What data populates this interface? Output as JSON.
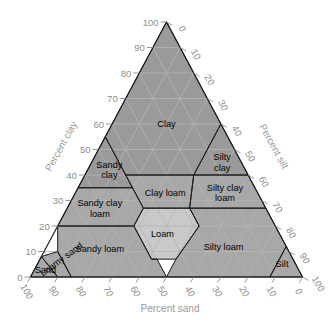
{
  "figure": {
    "type": "soil-texture-triangle",
    "background_color": "#ffffff"
  },
  "chart_data": {
    "type": "ternary-diagram",
    "title": "",
    "axes": [
      {
        "name": "clay",
        "label": "Percent clay",
        "position": "left",
        "range": [
          0,
          100
        ],
        "ticks": [
          0,
          10,
          20,
          30,
          40,
          50,
          60,
          70,
          80,
          90,
          100
        ]
      },
      {
        "name": "silt",
        "label": "Percent silt",
        "position": "right",
        "range": [
          0,
          100
        ],
        "ticks": [
          0,
          10,
          20,
          30,
          40,
          50,
          60,
          70,
          80,
          90,
          100
        ]
      },
      {
        "name": "sand",
        "label": "Percent sand",
        "position": "bottom",
        "range": [
          0,
          100
        ],
        "ticks": [
          0,
          10,
          20,
          30,
          40,
          50,
          60,
          70,
          80,
          90,
          100
        ]
      }
    ],
    "grid": true,
    "grid_interval": 10,
    "legend": "none",
    "colors": {
      "fill_dark": "#9a9a9a",
      "fill_mid": "#a8a8a8",
      "fill_light": "#c9c9c9",
      "grid_line": "#b5b5b5",
      "boundary_line": "#1a1a1a",
      "tick_text": "#8d8d8d",
      "axis_title": "#9a9a9a",
      "label_text": "#000000"
    },
    "regions": [
      {
        "name": "clay",
        "label": "Clay",
        "shade": "dark",
        "label_position": {
          "clay": 60,
          "silt": 20,
          "sand": 20
        },
        "vertices": [
          {
            "clay": 100,
            "silt": 0,
            "sand": 0
          },
          {
            "clay": 55,
            "silt": 0,
            "sand": 45
          },
          {
            "clay": 40,
            "silt": 15,
            "sand": 45
          },
          {
            "clay": 40,
            "silt": 40,
            "sand": 20
          },
          {
            "clay": 60,
            "silt": 40,
            "sand": 0
          }
        ]
      },
      {
        "name": "sandy-clay",
        "label": "Sandy\nclay",
        "label_lines": [
          "Sandy",
          "clay"
        ],
        "shade": "dark",
        "label_position": {
          "clay": 42,
          "silt": 8,
          "sand": 50
        },
        "vertices": [
          {
            "clay": 55,
            "silt": 0,
            "sand": 45
          },
          {
            "clay": 35,
            "silt": 0,
            "sand": 65
          },
          {
            "clay": 35,
            "silt": 20,
            "sand": 45
          }
        ]
      },
      {
        "name": "silty-clay",
        "label": "Silty\nclay",
        "label_lines": [
          "Silty",
          "clay"
        ],
        "shade": "dark",
        "label_position": {
          "clay": 45,
          "silt": 48,
          "sand": 7
        },
        "vertices": [
          {
            "clay": 60,
            "silt": 40,
            "sand": 0
          },
          {
            "clay": 40,
            "silt": 40,
            "sand": 20
          },
          {
            "clay": 40,
            "silt": 60,
            "sand": 0
          }
        ]
      },
      {
        "name": "sandy-clay-loam",
        "label": "Sandy clay\nloam",
        "label_lines": [
          "Sandy clay",
          "loam"
        ],
        "shade": "mid",
        "label_position": {
          "clay": 27,
          "silt": 12,
          "sand": 61
        },
        "vertices": [
          {
            "clay": 35,
            "silt": 0,
            "sand": 65
          },
          {
            "clay": 20,
            "silt": 0,
            "sand": 80
          },
          {
            "clay": 20,
            "silt": 28,
            "sand": 52
          },
          {
            "clay": 27,
            "silt": 28,
            "sand": 45
          },
          {
            "clay": 35,
            "silt": 20,
            "sand": 45
          }
        ]
      },
      {
        "name": "clay-loam",
        "label": "Clay loam",
        "shade": "mid",
        "label_position": {
          "clay": 33,
          "silt": 33,
          "sand": 34
        },
        "vertices": [
          {
            "clay": 40,
            "silt": 15,
            "sand": 45
          },
          {
            "clay": 27,
            "silt": 28,
            "sand": 45
          },
          {
            "clay": 27,
            "silt": 45,
            "sand": 28
          },
          {
            "clay": 40,
            "silt": 40,
            "sand": 20
          }
        ]
      },
      {
        "name": "silty-clay-loam",
        "label": "Silty clay\nloam",
        "label_lines": [
          "Silty clay",
          "loam"
        ],
        "shade": "mid",
        "label_position": {
          "clay": 33,
          "silt": 55,
          "sand": 12
        },
        "vertices": [
          {
            "clay": 40,
            "silt": 40,
            "sand": 20
          },
          {
            "clay": 27,
            "silt": 45,
            "sand": 28
          },
          {
            "clay": 27,
            "silt": 73,
            "sand": 0
          },
          {
            "clay": 40,
            "silt": 60,
            "sand": 0
          }
        ]
      },
      {
        "name": "loam",
        "label": "Loam",
        "shade": "light",
        "label_position": {
          "clay": 17,
          "silt": 40,
          "sand": 43
        },
        "vertices": [
          {
            "clay": 27,
            "silt": 28,
            "sand": 45
          },
          {
            "clay": 20,
            "silt": 28,
            "sand": 52
          },
          {
            "clay": 7,
            "silt": 41,
            "sand": 52
          },
          {
            "clay": 7,
            "silt": 50,
            "sand": 43
          },
          {
            "clay": 20,
            "silt": 52,
            "sand": 28
          },
          {
            "clay": 27,
            "silt": 45,
            "sand": 28
          }
        ]
      },
      {
        "name": "sandy-loam",
        "label": "Sandy loam",
        "shade": "mid",
        "label_position": {
          "clay": 11,
          "silt": 20,
          "sand": 69
        },
        "vertices": [
          {
            "clay": 20,
            "silt": 0,
            "sand": 80
          },
          {
            "clay": 20,
            "silt": 28,
            "sand": 52
          },
          {
            "clay": 7,
            "silt": 41,
            "sand": 52
          },
          {
            "clay": 7,
            "silt": 43,
            "sand": 50
          },
          {
            "clay": 0,
            "silt": 50,
            "sand": 50
          },
          {
            "clay": 0,
            "silt": 15,
            "sand": 85
          },
          {
            "clay": 10,
            "silt": 5,
            "sand": 85
          }
        ]
      },
      {
        "name": "silty-loam",
        "label": "Silty loam",
        "shade": "mid",
        "label_position": {
          "clay": 12,
          "silt": 65,
          "sand": 23
        },
        "vertices": [
          {
            "clay": 27,
            "silt": 73,
            "sand": 0
          },
          {
            "clay": 27,
            "silt": 45,
            "sand": 28
          },
          {
            "clay": 20,
            "silt": 52,
            "sand": 28
          },
          {
            "clay": 7,
            "silt": 50,
            "sand": 43
          },
          {
            "clay": 0,
            "silt": 50,
            "sand": 50
          },
          {
            "clay": 0,
            "silt": 88,
            "sand": 12
          },
          {
            "clay": 12,
            "silt": 88,
            "sand": 0
          }
        ]
      },
      {
        "name": "silt",
        "label": "Silt",
        "shade": "mid",
        "label_position": {
          "clay": 5,
          "silt": 90,
          "sand": 5
        },
        "vertices": [
          {
            "clay": 12,
            "silt": 88,
            "sand": 0
          },
          {
            "clay": 0,
            "silt": 88,
            "sand": 12
          },
          {
            "clay": 0,
            "silt": 100,
            "sand": 0
          }
        ]
      },
      {
        "name": "loamy-sand",
        "label": "Loamy sand",
        "shade": "mid",
        "label_position": {
          "clay": 6,
          "silt": 9,
          "sand": 85
        },
        "vertices": [
          {
            "clay": 10,
            "silt": 5,
            "sand": 85
          },
          {
            "clay": 0,
            "silt": 15,
            "sand": 85
          },
          {
            "clay": 0,
            "silt": 10,
            "sand": 90
          },
          {
            "clay": 8,
            "silt": 0,
            "sand": 92
          }
        ]
      },
      {
        "name": "sand",
        "label": "Sand",
        "shade": "mid",
        "label_position": {
          "clay": 3,
          "silt": 4,
          "sand": 93
        },
        "vertices": [
          {
            "clay": 8,
            "silt": 0,
            "sand": 92
          },
          {
            "clay": 0,
            "silt": 10,
            "sand": 90
          },
          {
            "clay": 0,
            "silt": 0,
            "sand": 100
          }
        ]
      }
    ]
  }
}
